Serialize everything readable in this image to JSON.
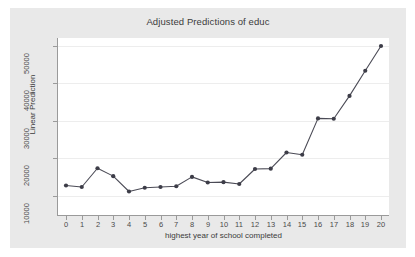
{
  "chart_data": {
    "type": "line",
    "title": "Adjusted Predictions of educ",
    "subtitle": "",
    "xlabel": "highest year of school completed",
    "ylabel": "Linear Prediction",
    "x": [
      0,
      1,
      2,
      3,
      4,
      5,
      6,
      7,
      8,
      9,
      10,
      11,
      12,
      13,
      14,
      15,
      16,
      17,
      18,
      19,
      20
    ],
    "values": [
      12800,
      12400,
      17400,
      15300,
      11200,
      12200,
      12400,
      12600,
      15100,
      13600,
      13700,
      13200,
      17200,
      17300,
      21600,
      21000,
      30700,
      30600,
      36700,
      43400,
      50000
    ],
    "series": [
      {
        "name": "Linear Prediction",
        "values": [
          12800,
          12400,
          17400,
          15300,
          11200,
          12200,
          12400,
          12600,
          15100,
          13600,
          13700,
          13200,
          17200,
          17300,
          21600,
          21000,
          30700,
          30600,
          36700,
          43400,
          50000
        ]
      }
    ],
    "xtick_labels": [
      "0",
      "1",
      "2",
      "3",
      "4",
      "5",
      "6",
      "7",
      "8",
      "9",
      "10",
      "11",
      "12",
      "13",
      "14",
      "15",
      "16",
      "17",
      "18",
      "19",
      "20"
    ],
    "ytick_labels": [
      "10000",
      "20000",
      "30000",
      "40000",
      "50000"
    ],
    "ytick_values": [
      10000,
      20000,
      30000,
      40000,
      50000
    ],
    "xlim": [
      -0.6,
      20.6
    ],
    "ylim": [
      8500,
      53000
    ],
    "grid": "horizontal",
    "legend": "none",
    "line_color": "#4b4b56",
    "marker_color": "#3d3d48",
    "marker_shape": "circle",
    "plot_background": "#ffffff",
    "graph_background": "#e9e9e9",
    "gridline_color": "#ededed",
    "axis_color": "#9a9a9a"
  }
}
